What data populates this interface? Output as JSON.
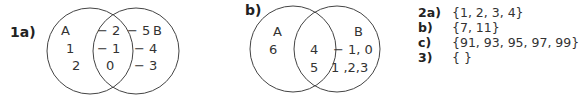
{
  "venn_1a": {
    "label": "1a)",
    "set_a": "A",
    "set_b": "B",
    "only_a": [
      "1",
      "2"
    ],
    "intersection": [
      "− 2",
      "− 1",
      "0"
    ],
    "only_b": [
      "− 5",
      "− 4",
      "− 3"
    ]
  },
  "venn_b": {
    "label": "b)",
    "set_a": "A",
    "set_b": "B",
    "only_a": [
      "6"
    ],
    "intersection": [
      "4",
      "5"
    ],
    "only_b": [
      "− 1, 0",
      "1 ,2,3"
    ]
  },
  "answers": [
    {
      "label": "2a)",
      "value": "{1, 2, 3, 4}"
    },
    {
      "label": "b)",
      "value": "{7, 11}"
    },
    {
      "label": "c)",
      "value": "{91, 93, 95, 97, 99}"
    },
    {
      "label": "3)",
      "value": "{ }"
    }
  ]
}
